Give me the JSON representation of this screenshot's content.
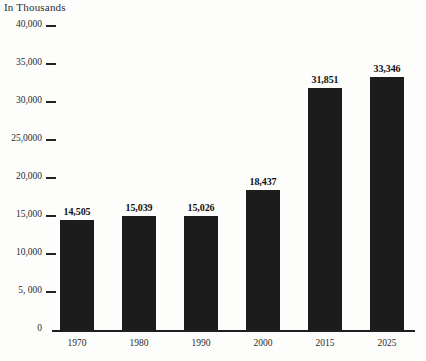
{
  "chart_data": {
    "type": "bar",
    "title": "In Thousands",
    "xlabel": "",
    "ylabel": "",
    "categories": [
      "1970",
      "1980",
      "1990",
      "2000",
      "2015",
      "2025"
    ],
    "values": [
      14505,
      15039,
      15026,
      18437,
      31851,
      33346
    ],
    "value_labels": [
      "14,505",
      "15,039",
      "15,026",
      "18,437",
      "31,851",
      "33,346"
    ],
    "ylim": [
      0,
      40000
    ],
    "ytick_values": [
      0,
      5000,
      10000,
      15000,
      20000,
      25000,
      30000,
      35000,
      40000
    ],
    "ytick_labels": [
      "0",
      "5, 000",
      "10,000",
      "15,000",
      "20,000",
      "25,0000",
      "30,000",
      "35,000",
      "40,000"
    ],
    "grid": false,
    "legend": null,
    "bar_color": "#1c1c1c",
    "background_color": "#fdfdfc",
    "text_color": "#2b2b2b"
  }
}
